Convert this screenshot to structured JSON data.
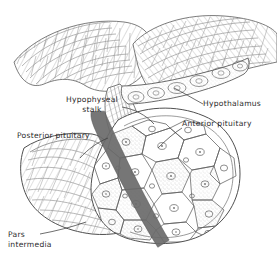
{
  "figure": {
    "kind": "anatomical-line-drawing",
    "style": "pen-and-ink hatched histology illustration",
    "background_color": "#ffffff",
    "ink_color": "#3a3a3a",
    "hatch_color": "#8d8d8d",
    "pars_intermedia_color": "#6e6e6e"
  },
  "labels": {
    "hypophyseal_stalk": "Hypophyseal\nstalk",
    "hypothalamus": "Hypothalamus",
    "anterior_pituitary": "Anterior pituitary",
    "posterior_pituitary": "Posterior pituitary",
    "pars_intermedia": "Pars\nintermedia"
  }
}
